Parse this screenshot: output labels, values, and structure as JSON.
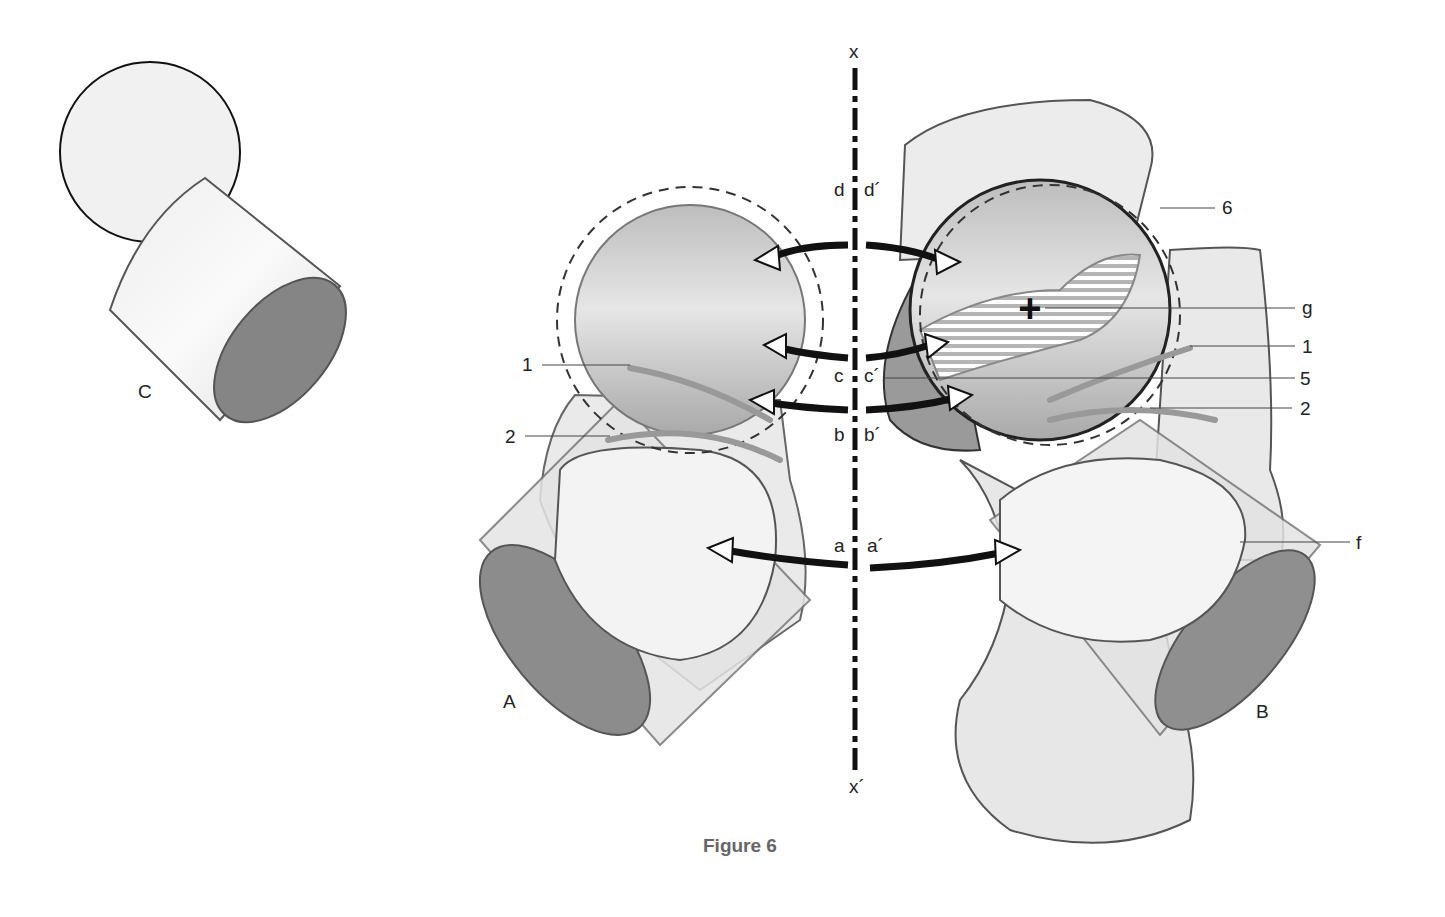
{
  "figure": {
    "caption": "Figure 6",
    "views": {
      "A": "A",
      "B": "B",
      "C": "C"
    },
    "axis": {
      "top": "x",
      "bottom": "x´"
    },
    "level_labels": {
      "d": "d",
      "d_prime": "d´",
      "c": "c",
      "c_prime": "c´",
      "b": "b",
      "b_prime": "b´",
      "a": "a",
      "a_prime": "a´"
    },
    "left_callouts": {
      "one": "1",
      "two": "2"
    },
    "right_callouts": {
      "six": "6",
      "g": "g",
      "one": "1",
      "five": "5",
      "two": "2",
      "f": "f"
    },
    "colors": {
      "outline": "#555555",
      "fill_light": "#ececec",
      "fill_shadow": "#8f8f8f",
      "arrow": "#111111",
      "caption": "#666666"
    }
  }
}
